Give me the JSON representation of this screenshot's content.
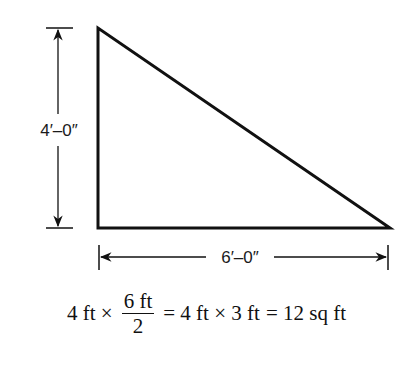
{
  "diagram": {
    "shape": "right-triangle",
    "height_label": "4′–0″",
    "width_label": "6′–0″",
    "stroke_color": "#111111"
  },
  "formula": {
    "term1": "4 ft ×",
    "fraction_numerator": "6 ft",
    "fraction_denominator": "2",
    "step2": "= 4 ft × 3 ft",
    "result": "= 12 sq ft"
  }
}
